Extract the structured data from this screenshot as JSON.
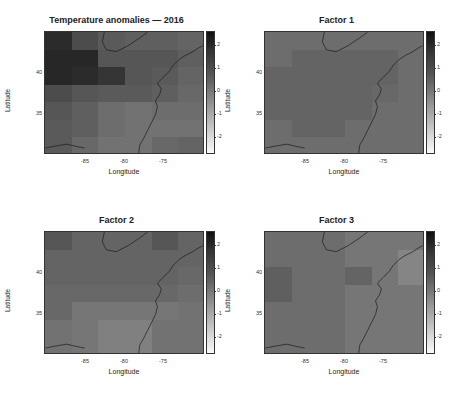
{
  "chart_data": [
    {
      "type": "heatmap",
      "title": "Temperature anomalies — 2016",
      "xlabel": "Longitude",
      "ylabel": "Latitude",
      "xticks": [
        "-85",
        "-80",
        "-75"
      ],
      "yticks": [
        "40",
        "35"
      ],
      "colorbar_ticks": [
        "2",
        "1",
        "0",
        "-1",
        "-2"
      ],
      "colorbar_range": [
        -2.5,
        2.5
      ],
      "grid": [
        [
          1.9,
          1.2,
          0.9,
          0.8,
          0.8,
          0.7
        ],
        [
          2.0,
          2.0,
          1.0,
          1.0,
          1.0,
          0.8
        ],
        [
          2.0,
          1.9,
          1.7,
          1.0,
          0.9,
          0.7
        ],
        [
          1.2,
          1.0,
          0.9,
          0.9,
          0.8,
          0.6
        ],
        [
          1.0,
          0.8,
          0.5,
          0.4,
          0.5,
          0.5
        ],
        [
          0.9,
          0.8,
          0.5,
          0.4,
          0.4,
          0.4
        ],
        [
          0.9,
          0.6,
          0.4,
          0.4,
          0.6,
          0.7
        ]
      ]
    },
    {
      "type": "heatmap",
      "title": "Factor 1",
      "xlabel": "Longitude",
      "ylabel": "Latitude",
      "xticks": [
        "-85",
        "-80",
        "-75"
      ],
      "yticks": [
        "40",
        "35"
      ],
      "colorbar_ticks": [
        "2",
        "1",
        "0",
        "-1",
        "-2"
      ],
      "colorbar_range": [
        -2.5,
        2.5
      ],
      "grid": [
        [
          0.5,
          0.5,
          0.5,
          0.5,
          0.5,
          0.5
        ],
        [
          0.5,
          0.7,
          0.7,
          0.7,
          0.7,
          0.5
        ],
        [
          0.7,
          0.7,
          0.7,
          0.7,
          0.7,
          0.5
        ],
        [
          0.7,
          0.7,
          0.7,
          0.7,
          0.6,
          0.5
        ],
        [
          0.7,
          0.7,
          0.7,
          0.7,
          0.5,
          0.5
        ],
        [
          0.5,
          0.7,
          0.7,
          0.5,
          0.5,
          0.5
        ],
        [
          0.5,
          0.5,
          0.5,
          0.5,
          0.5,
          0.5
        ]
      ]
    },
    {
      "type": "heatmap",
      "title": "Factor 2",
      "xlabel": "Longitude",
      "ylabel": "Latitude",
      "xticks": [
        "-85",
        "-80",
        "-75"
      ],
      "yticks": [
        "40",
        "35"
      ],
      "colorbar_ticks": [
        "2",
        "1",
        "0",
        "-1",
        "-2"
      ],
      "colorbar_range": [
        -2.5,
        2.5
      ],
      "grid": [
        [
          1.0,
          0.7,
          0.7,
          0.7,
          1.0,
          0.7
        ],
        [
          0.7,
          0.7,
          0.7,
          0.7,
          0.7,
          0.7
        ],
        [
          0.7,
          0.7,
          0.7,
          0.7,
          0.7,
          0.6
        ],
        [
          0.6,
          0.6,
          0.6,
          0.6,
          0.6,
          0.5
        ],
        [
          0.6,
          0.3,
          0.3,
          0.3,
          0.3,
          0.4
        ],
        [
          0.4,
          0.3,
          0.1,
          0.1,
          0.4,
          0.4
        ],
        [
          0.4,
          0.3,
          0.1,
          0.1,
          0.4,
          0.4
        ]
      ]
    },
    {
      "type": "heatmap",
      "title": "Factor 3",
      "xlabel": "Longitude",
      "ylabel": "Latitude",
      "xticks": [
        "-85",
        "-80",
        "-75"
      ],
      "yticks": [
        "40",
        "35"
      ],
      "colorbar_ticks": [
        "2",
        "1",
        "0",
        "-1",
        "-2"
      ],
      "colorbar_range": [
        -2.5,
        2.5
      ],
      "grid": [
        [
          0.5,
          0.5,
          0.5,
          0.3,
          0.3,
          0.3
        ],
        [
          0.5,
          0.5,
          0.5,
          0.3,
          0.3,
          0.0
        ],
        [
          0.8,
          0.5,
          0.5,
          0.7,
          0.3,
          0.0
        ],
        [
          0.8,
          0.5,
          0.5,
          0.3,
          0.3,
          0.3
        ],
        [
          0.5,
          0.5,
          0.5,
          0.3,
          0.3,
          0.3
        ],
        [
          0.5,
          0.5,
          0.5,
          0.3,
          0.3,
          0.3
        ],
        [
          0.5,
          0.5,
          0.5,
          0.3,
          0.3,
          0.3
        ]
      ]
    }
  ]
}
